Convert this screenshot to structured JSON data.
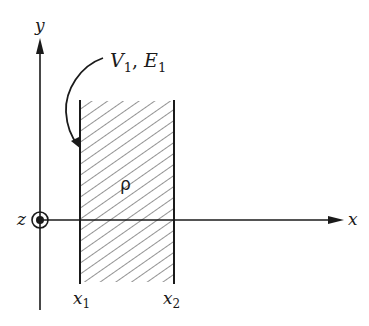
{
  "diagram": {
    "axes": {
      "x_label": "x",
      "y_label": "y",
      "z_label": "z",
      "z_direction": "out-of-page"
    },
    "slab": {
      "density_label": "ρ",
      "left_boundary_label": "x",
      "left_boundary_sub": "1",
      "right_boundary_label": "x",
      "right_boundary_sub": "2"
    },
    "annotation": {
      "v_text": "V",
      "v_sub": "1",
      "separator": ", ",
      "e_text": "E",
      "e_sub": "1"
    },
    "colors": {
      "ink": "#1a1a1a",
      "hatch": "#3a3a3a",
      "background": "#ffffff"
    }
  }
}
